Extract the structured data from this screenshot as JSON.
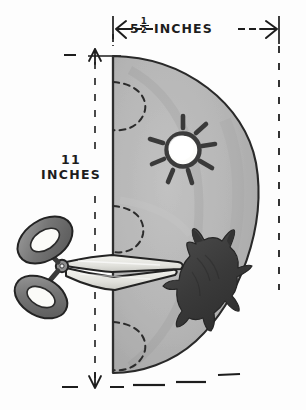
{
  "figure": {
    "background_color": "#fdfdfd",
    "paper_fill_color": "#b5b5b5",
    "paper_outline_color": "#2a2a2a",
    "ink_color": "#1d1d1d"
  },
  "dimensions": {
    "width_label_prefix": "5",
    "width_fraction_numerator": "1",
    "width_fraction_denominator": "2",
    "width_unit": "INCHES",
    "height_value": "11",
    "height_unit": "INCHES"
  },
  "annotations": {
    "width_arrow": "horizontal-double-arrow",
    "height_arrow": "vertical-double-arrow",
    "guide_lines": "dashed",
    "fold_edge": "left-vertical-fold"
  },
  "shapes": [
    {
      "name": "sun-cutout",
      "label": "sun",
      "fill": "#ffffff",
      "rays": 8,
      "center_x": 183,
      "center_y": 150,
      "radius": 16
    },
    {
      "name": "animal-silhouette",
      "label": "horned animal",
      "fill": "#3d3d3d",
      "center_x": 207,
      "center_y": 277
    }
  ],
  "tools": [
    {
      "name": "scissors",
      "label": "scissors",
      "handle_color": "#7d7d7d",
      "blade_color": "#e8e8e4",
      "outline_color": "#252525"
    }
  ],
  "fold_arcs": [
    {
      "name": "fold-arc-top",
      "cy": 105
    },
    {
      "name": "fold-arc-middle",
      "cy": 228
    },
    {
      "name": "fold-arc-bottom",
      "cy": 345
    }
  ]
}
